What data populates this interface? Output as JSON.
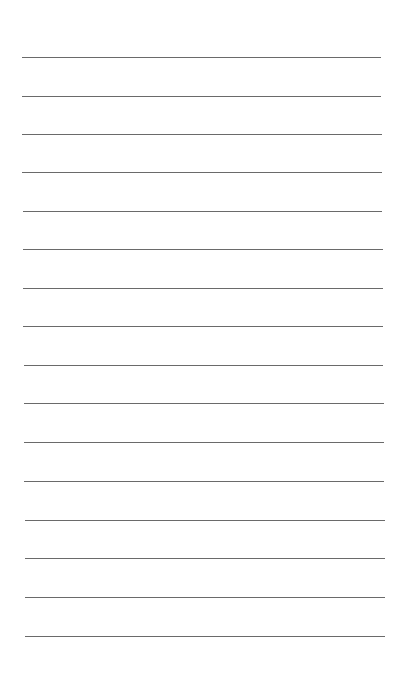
{
  "page": {
    "type": "lined-paper",
    "background_color": "#ffffff",
    "line_color": "#5a5a5a",
    "line_count": 16,
    "lines": [
      {
        "y": 57,
        "x1": 22,
        "x2": 381
      },
      {
        "y": 96,
        "x1": 22,
        "x2": 381
      },
      {
        "y": 134,
        "x1": 22,
        "x2": 382
      },
      {
        "y": 172,
        "x1": 22,
        "x2": 382
      },
      {
        "y": 211,
        "x1": 23,
        "x2": 382
      },
      {
        "y": 249,
        "x1": 23,
        "x2": 383
      },
      {
        "y": 288,
        "x1": 23,
        "x2": 383
      },
      {
        "y": 326,
        "x1": 23,
        "x2": 383
      },
      {
        "y": 365,
        "x1": 24,
        "x2": 383
      },
      {
        "y": 403,
        "x1": 24,
        "x2": 384
      },
      {
        "y": 442,
        "x1": 24,
        "x2": 384
      },
      {
        "y": 481,
        "x1": 24,
        "x2": 384
      },
      {
        "y": 520,
        "x1": 25,
        "x2": 385
      },
      {
        "y": 558,
        "x1": 25,
        "x2": 385
      },
      {
        "y": 597,
        "x1": 25,
        "x2": 385
      },
      {
        "y": 636,
        "x1": 25,
        "x2": 385
      }
    ]
  }
}
